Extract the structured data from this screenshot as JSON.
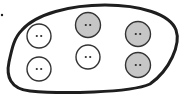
{
  "diagram": {
    "colors": {
      "background": "#ffffff",
      "outline": "#1e1e1e",
      "circle_stroke": "#333333",
      "white_fill": "#ffffff",
      "gray_fill": "#c6c6c6",
      "eye": "#2a2a2a"
    },
    "marker_dot": {
      "cx": 2,
      "cy": 15,
      "r": 1.2
    },
    "circles": [
      {
        "id": "white-top-left",
        "fill": "white",
        "cx": 39,
        "cy": 36,
        "r": 12
      },
      {
        "id": "white-bottom-left",
        "fill": "white",
        "cx": 39,
        "cy": 69,
        "r": 12
      },
      {
        "id": "gray-top-middle",
        "fill": "gray",
        "cx": 88,
        "cy": 25,
        "r": 12.5
      },
      {
        "id": "white-middle",
        "fill": "white",
        "cx": 88,
        "cy": 57,
        "r": 12
      },
      {
        "id": "gray-right-top",
        "fill": "gray",
        "cx": 138,
        "cy": 34,
        "r": 12.5
      },
      {
        "id": "gray-right-bottom",
        "fill": "gray",
        "cx": 138,
        "cy": 65,
        "r": 12.5
      }
    ],
    "counts": {
      "white": 3,
      "gray": 3,
      "total": 6
    }
  }
}
